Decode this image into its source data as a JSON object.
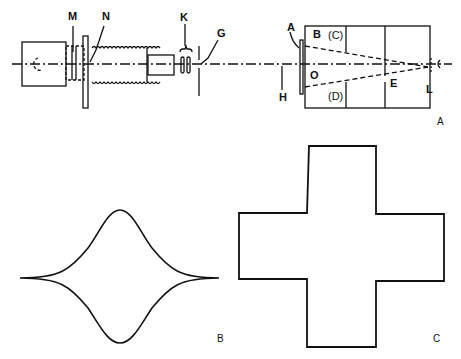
{
  "figure": {
    "panels": [
      {
        "id": "A",
        "label": "A",
        "description": "Optical apparatus side view"
      },
      {
        "id": "B",
        "label": "B",
        "description": "Cusped lens-shaped (astroid-like) curve"
      },
      {
        "id": "C",
        "label": "C",
        "description": "Greek cross outline"
      }
    ],
    "callouts": {
      "M": "M",
      "N": "N",
      "K": "K",
      "G": "G",
      "A": "A",
      "B": "B",
      "C": "(C)",
      "O": "O",
      "D": "(D)",
      "E": "E",
      "H": "H",
      "L": "L"
    },
    "colors": {
      "line": "#111111",
      "background": "#ffffff"
    }
  }
}
